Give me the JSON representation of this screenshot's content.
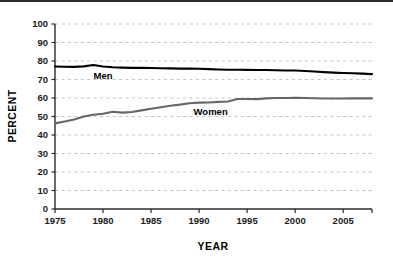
{
  "chart_data": {
    "type": "line",
    "title": "",
    "xlabel": "YEAR",
    "ylabel": "PERCENT",
    "xlim": [
      1975,
      2008
    ],
    "ylim": [
      0,
      100
    ],
    "grid": true,
    "grid_axis": "y",
    "grid_style": "dashed",
    "legend": "inline-annotations",
    "x_ticks": [
      1975,
      1980,
      1985,
      1990,
      1995,
      2000,
      2005
    ],
    "x_tick_labels": [
      "1975",
      "1980",
      "1985",
      "1990",
      "1995",
      "2000",
      "2005"
    ],
    "y_ticks": [
      0,
      10,
      20,
      30,
      40,
      50,
      60,
      70,
      80,
      90,
      100
    ],
    "y_tick_labels": [
      "0",
      "10",
      "20",
      "30",
      "40",
      "50",
      "60",
      "70",
      "80",
      "90",
      "100"
    ],
    "x": [
      1975,
      1976,
      1977,
      1978,
      1979,
      1980,
      1981,
      1982,
      1983,
      1984,
      1985,
      1986,
      1987,
      1988,
      1989,
      1990,
      1991,
      1992,
      1993,
      1994,
      1995,
      1996,
      1997,
      1998,
      1999,
      2000,
      2001,
      2002,
      2003,
      2004,
      2005,
      2006,
      2007,
      2008
    ],
    "series": [
      {
        "name": "Men",
        "color": "#000000",
        "label": "Men",
        "label_x": 1980.0,
        "label_y": 70.5,
        "values": [
          77.0,
          76.9,
          76.8,
          77.1,
          77.8,
          77.0,
          76.6,
          76.4,
          76.3,
          76.3,
          76.2,
          76.1,
          76.0,
          75.9,
          75.9,
          75.8,
          75.6,
          75.4,
          75.3,
          75.3,
          75.2,
          75.1,
          75.1,
          75.0,
          74.9,
          74.9,
          74.6,
          74.3,
          74.0,
          73.7,
          73.5,
          73.4,
          73.2,
          72.9
        ]
      },
      {
        "name": "Women",
        "color": "#666666",
        "label": "Women",
        "label_x": 1991.2,
        "label_y": 51.0,
        "values": [
          46.3,
          47.3,
          48.4,
          50.0,
          50.9,
          51.5,
          52.6,
          52.1,
          52.4,
          53.3,
          54.2,
          55.0,
          55.8,
          56.4,
          57.2,
          57.5,
          57.6,
          57.9,
          58.1,
          59.5,
          59.5,
          59.4,
          59.8,
          60.0,
          60.0,
          60.1,
          60.0,
          59.9,
          59.7,
          59.7,
          59.7,
          59.8,
          59.8,
          59.8
        ]
      }
    ]
  },
  "axes": {
    "y_title": "PERCENT",
    "x_title": "YEAR"
  }
}
